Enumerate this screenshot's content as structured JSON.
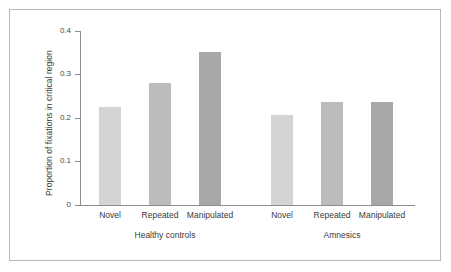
{
  "chart_data": {
    "type": "bar",
    "title": "",
    "subtitle": "",
    "xlabel": "",
    "ylabel": "Proportion of fixations in critical region",
    "ylim": [
      0,
      0.4
    ],
    "ytick_labels": [
      "0",
      "0.1",
      "0.2",
      "0.3",
      "0.4"
    ],
    "ytick_values": [
      0,
      0.1,
      0.2,
      0.3,
      0.4
    ],
    "grid": false,
    "legend": null,
    "groups": [
      {
        "name": "Healthy controls",
        "categories": [
          "Novel",
          "Repeated",
          "Manipulated"
        ],
        "values": [
          0.225,
          0.28,
          0.352
        ]
      },
      {
        "name": "Amnesics",
        "categories": [
          "Novel",
          "Repeated",
          "Manipulated"
        ],
        "values": [
          0.207,
          0.236,
          0.236
        ]
      }
    ],
    "categories": [
      "Novel",
      "Repeated",
      "Manipulated",
      "Novel",
      "Repeated",
      "Manipulated"
    ],
    "values": [
      0.225,
      0.28,
      0.352,
      0.207,
      0.236,
      0.236
    ],
    "bar_colors": [
      "#d4d4d4",
      "#bcbcbc",
      "#a8a8a8",
      "#d4d4d4",
      "#bcbcbc",
      "#a8a8a8"
    ],
    "axis_color": "#8d8d8d",
    "frame_color": "#b9b9b9",
    "text_color": "#3a3a3a"
  }
}
